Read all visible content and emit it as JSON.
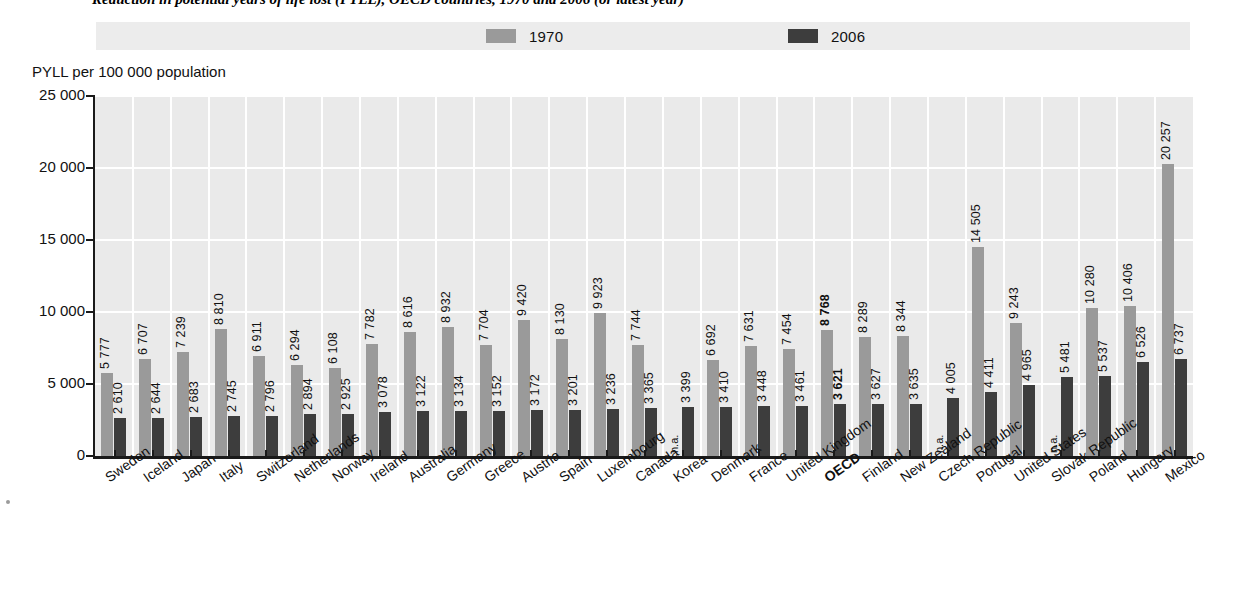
{
  "figure": {
    "number": "1.5.2",
    "title": "Reduction in potential years of life lost (PYLL), OECD countries, 1970 and 2006 (or latest year)"
  },
  "legend": {
    "position": "top",
    "entries": [
      {
        "label": "1970",
        "color": "#9a9a9a"
      },
      {
        "label": "2006",
        "color": "#3d3d3d"
      }
    ]
  },
  "axis": {
    "ylabel": "PYLL per 100 000 population",
    "yticks": [
      "0",
      "5 000",
      "10 000",
      "15 000",
      "20 000",
      "25 000"
    ],
    "na_label": "n.a."
  },
  "chart_data": {
    "type": "bar",
    "title": "Reduction in potential years of life lost (PYLL), OECD countries, 1970 and 2006 (or latest year)",
    "xlabel": "",
    "ylabel": "PYLL per 100 000 population",
    "ylim": [
      0,
      25000
    ],
    "ytick_values": [
      0,
      5000,
      10000,
      15000,
      20000,
      25000
    ],
    "grid": true,
    "legend_position": "top",
    "categories": [
      "Sweden",
      "Iceland",
      "Japan",
      "Italy",
      "Switzerland",
      "Netherlands",
      "Norway",
      "Ireland",
      "Australia",
      "Germany",
      "Greece",
      "Austria",
      "Spain",
      "Luxembourg",
      "Canada",
      "Korea",
      "Denmark",
      "France",
      "United Kingdom",
      "OECD",
      "Finland",
      "New Zealand",
      "Czech Republic",
      "Portugal",
      "United States",
      "Slovak Republic",
      "Poland",
      "Hungary",
      "Mexico"
    ],
    "highlight_category": "OECD",
    "series": [
      {
        "name": "1970",
        "color": "#9a9a9a",
        "values": [
          5777,
          6707,
          7239,
          8810,
          6911,
          6294,
          6108,
          7782,
          8616,
          8932,
          7704,
          9420,
          8130,
          9923,
          7744,
          null,
          6692,
          7631,
          7454,
          8768,
          8289,
          8344,
          null,
          14505,
          9243,
          null,
          10280,
          10406,
          20257
        ],
        "labels": [
          "5 777",
          "6 707",
          "7 239",
          "8 810",
          "6 911",
          "6 294",
          "6 108",
          "7 782",
          "8 616",
          "8 932",
          "7 704",
          "9 420",
          "8 130",
          "9 923",
          "7 744",
          "n.a.",
          "6 692",
          "7 631",
          "7 454",
          "8 768",
          "8 289",
          "8 344",
          "n.a.",
          "14 505",
          "9 243",
          "n.a.",
          "10 280",
          "10 406",
          "20 257"
        ]
      },
      {
        "name": "2006",
        "color": "#3d3d3d",
        "values": [
          2610,
          2644,
          2683,
          2745,
          2796,
          2894,
          2925,
          3078,
          3122,
          3134,
          3152,
          3172,
          3201,
          3236,
          3365,
          3399,
          3410,
          3448,
          3461,
          3621,
          3627,
          3635,
          4005,
          4411,
          4965,
          5481,
          5537,
          6526,
          6737
        ],
        "labels": [
          "2 610",
          "2 644",
          "2 683",
          "2 745",
          "2 796",
          "2 894",
          "2 925",
          "3 078",
          "3 122",
          "3 134",
          "3 152",
          "3 172",
          "3 201",
          "3 236",
          "3 365",
          "3 399",
          "3 410",
          "3 448",
          "3 461",
          "3 621",
          "3 627",
          "3 635",
          "4 005",
          "4 411",
          "4 965",
          "5 481",
          "5 537",
          "6 526",
          "6 737"
        ]
      }
    ]
  }
}
